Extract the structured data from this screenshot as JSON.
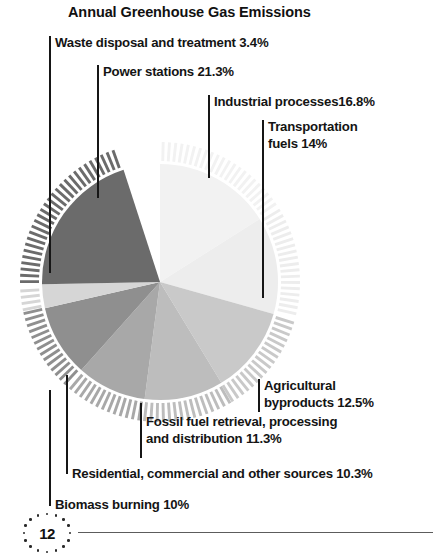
{
  "title": "Annual Greenhouse Gas Emissions",
  "page_number": "12",
  "chart_data": {
    "type": "pie",
    "title": "Annual Greenhouse Gas Emissions",
    "xlabel": "",
    "ylabel": "",
    "legend_position": "callout-labels",
    "grid": false,
    "categories": [
      "Industrial processes",
      "Transportation fuels",
      "Agricultural byproducts",
      "Fossil fuel retrieval, processing and distribution",
      "Biomass burning",
      "Residential, commercial and other sources",
      "Waste disposal and treatment",
      "Power stations"
    ],
    "values": [
      16.8,
      14,
      12.5,
      11.3,
      10,
      10.3,
      3.4,
      21.3
    ],
    "units": "%",
    "slice_colors": [
      "#f2f2f2",
      "#ededed",
      "#c9c9c9",
      "#bdbdbd",
      "#a8a8a8",
      "#8f8f8f",
      "#d6d6d6",
      "#6b6b6b"
    ],
    "annotations": [
      "Waste disposal and treatment 3.4%",
      "Power stations 21.3%",
      "Industrial processes16.8%",
      "Transportation fuels 14%",
      "Agricultural byproducts 12.5%",
      "Fossil fuel retrieval, processing and distribution 11.3%",
      "Residential, commercial and other sources 10.3%",
      "Biomass burning 10%"
    ]
  },
  "labels": {
    "waste": "Waste disposal and treatment 3.4%",
    "power": "Power stations 21.3%",
    "industrial": "Industrial processes16.8%",
    "transportation": "Transportation\nfuels 14%",
    "agricultural": "Agricultural\nbyproducts 12.5%",
    "fossil": "Fossil fuel retrieval, processing\nand distribution 11.3%",
    "residential": "Residential, commercial and other sources 10.3%",
    "biomass": "Biomass burning 10%"
  }
}
